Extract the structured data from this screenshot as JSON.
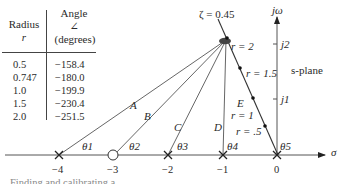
{
  "table": {
    "headers": {
      "radius": "Radius",
      "radius_sym": "r",
      "angle": "Angle",
      "angle_sym": "∠",
      "angle_unit": "(degrees)"
    },
    "rows": [
      {
        "r": "0.5",
        "angle": "−158.4"
      },
      {
        "r": "0.747",
        "angle": "−180.0"
      },
      {
        "r": "1.0",
        "angle": "−199.9"
      },
      {
        "r": "1.5",
        "angle": "−230.4"
      },
      {
        "r": "2.0",
        "angle": "−251.5"
      }
    ]
  },
  "plot": {
    "zeta_label": "ζ = 0.45",
    "jw_label": "jω",
    "sigma_label": "σ",
    "s_plane_label": "s-plane",
    "j_ticks": [
      "j2",
      "j1"
    ],
    "x_ticks": [
      "−4",
      "−3",
      "−2",
      "−1",
      "0"
    ],
    "vector_labels": [
      "A",
      "B",
      "C",
      "D",
      "E"
    ],
    "theta_labels": [
      "θ1",
      "θ2",
      "θ3",
      "θ4",
      "θ5"
    ],
    "r_labels": [
      "r = 2",
      "r = 1.5",
      "r = 1",
      "r = .5"
    ],
    "poles": [
      "−4",
      "−2",
      "−1",
      "0"
    ],
    "zeros": [
      "−3"
    ]
  },
  "footer_fragment": "Finding and calibrating a ..."
}
